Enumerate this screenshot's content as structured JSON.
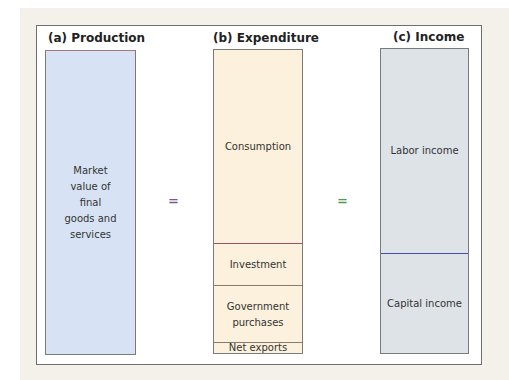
{
  "figure": {
    "panels": [
      {
        "id": "a",
        "title": "(a) Production",
        "fill": "#d7e3f4",
        "segments": [
          {
            "label": "Market\nvalue of\nfinal\ngoods and\nservices"
          }
        ]
      },
      {
        "id": "b",
        "title": "(b) Expenditure",
        "fill": "#fcf1dc",
        "segments": [
          {
            "label": "Consumption"
          },
          {
            "label": "Investment"
          },
          {
            "label": "Government\npurchases"
          },
          {
            "label": "Net exports"
          }
        ]
      },
      {
        "id": "c",
        "title": "(c) Income",
        "fill": "#dee3e8",
        "segments": [
          {
            "label": "Labor income"
          },
          {
            "label": "Capital income"
          }
        ]
      }
    ],
    "equals_sign": "=",
    "colors": {
      "equals_left": "#7a5a8a",
      "equals_right": "#4f9a4f",
      "investment_divider": "#a0506a",
      "income_divider": "#4a4ab0"
    }
  }
}
